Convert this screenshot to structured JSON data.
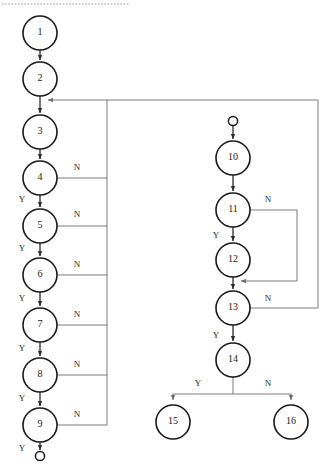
{
  "diagram": {
    "type": "flowchart",
    "background_color": "#ffffff",
    "node_stroke_color": "#1a1a1a",
    "edge_color": "#6e6e6e",
    "dark_edge_color": "#2b2b2b",
    "top_rule_color": "#b9b9b9"
  },
  "top_rule": {
    "name": "dashed-divider",
    "x1": 2,
    "x2": 130,
    "y": 4
  },
  "terminals": [
    {
      "id": "start-left-bottom",
      "label": "",
      "cx": 40,
      "cy": 456,
      "r": 4.6,
      "role": "end"
    },
    {
      "id": "start-right-top",
      "label": "",
      "cx": 233,
      "cy": 121,
      "r": 4.6,
      "role": "start"
    }
  ],
  "nodes": [
    {
      "id": "n1",
      "label": "1",
      "cx": 40,
      "cy": 33,
      "r": 17
    },
    {
      "id": "n2",
      "label": "2",
      "cx": 40,
      "cy": 79,
      "r": 17
    },
    {
      "id": "n3",
      "label": "3",
      "cx": 40,
      "cy": 132,
      "r": 17
    },
    {
      "id": "n4",
      "label": "4",
      "cx": 40,
      "cy": 178,
      "r": 17
    },
    {
      "id": "n5",
      "label": "5",
      "cx": 40,
      "cy": 226,
      "r": 17
    },
    {
      "id": "n6",
      "label": "6",
      "cx": 40,
      "cy": 275,
      "r": 17
    },
    {
      "id": "n7",
      "label": "7",
      "cx": 40,
      "cy": 325,
      "r": 17
    },
    {
      "id": "n8",
      "label": "8",
      "cx": 40,
      "cy": 375,
      "r": 17
    },
    {
      "id": "n9",
      "label": "9",
      "cx": 40,
      "cy": 425,
      "r": 17
    },
    {
      "id": "n10",
      "label": "10",
      "cx": 233,
      "cy": 158,
      "r": 17
    },
    {
      "id": "n11",
      "label": "11",
      "cx": 233,
      "cy": 210,
      "r": 17
    },
    {
      "id": "n12",
      "label": "12",
      "cx": 233,
      "cy": 260,
      "r": 17
    },
    {
      "id": "n13",
      "label": "13",
      "cx": 233,
      "cy": 308,
      "r": 17
    },
    {
      "id": "n14",
      "label": "14",
      "cx": 233,
      "cy": 360,
      "r": 17
    },
    {
      "id": "n15",
      "label": "15",
      "cx": 173,
      "cy": 422,
      "r": 17
    },
    {
      "id": "n16",
      "label": "16",
      "cx": 291,
      "cy": 422,
      "r": 17
    }
  ],
  "edge_labels": [
    {
      "id": "lbl-4-n",
      "text": "N",
      "x": 77,
      "y": 168
    },
    {
      "id": "lbl-5-n",
      "text": "N",
      "x": 77,
      "y": 215
    },
    {
      "id": "lbl-6-n",
      "text": "N",
      "x": 77,
      "y": 265
    },
    {
      "id": "lbl-7-n",
      "text": "N",
      "x": 77,
      "y": 315
    },
    {
      "id": "lbl-8-n",
      "text": "N",
      "x": 77,
      "y": 365
    },
    {
      "id": "lbl-9-n",
      "text": "N",
      "x": 77,
      "y": 415
    },
    {
      "id": "lbl-4-y",
      "text": "Y",
      "x": 22,
      "y": 200
    },
    {
      "id": "lbl-5-y",
      "text": "Y",
      "x": 22,
      "y": 249
    },
    {
      "id": "lbl-6-y",
      "text": "Y",
      "x": 22,
      "y": 299
    },
    {
      "id": "lbl-7-y",
      "text": "Y",
      "x": 22,
      "y": 349
    },
    {
      "id": "lbl-8-y",
      "text": "Y",
      "x": 22,
      "y": 399
    },
    {
      "id": "lbl-9-y",
      "text": "Y",
      "x": 22,
      "y": 449
    },
    {
      "id": "lbl-11-n",
      "text": "N",
      "x": 268,
      "y": 200
    },
    {
      "id": "lbl-11-y",
      "text": "Y",
      "x": 216,
      "y": 236
    },
    {
      "id": "lbl-13-n",
      "text": "N",
      "x": 268,
      "y": 299
    },
    {
      "id": "lbl-13-y",
      "text": "Y",
      "x": 216,
      "y": 336
    },
    {
      "id": "lbl-14-y",
      "text": "Y",
      "x": 198,
      "y": 384
    },
    {
      "id": "lbl-14-n",
      "text": "N",
      "x": 268,
      "y": 384
    }
  ],
  "edges": [
    {
      "id": "e-1-2",
      "from": "n1",
      "to": "n2",
      "kind": "vertical-arrow",
      "label": ""
    },
    {
      "id": "e-2-3",
      "from": "n2",
      "to": "n3",
      "kind": "vertical-arrow",
      "label": ""
    },
    {
      "id": "e-3-4",
      "from": "n3",
      "to": "n4",
      "kind": "vertical-arrow",
      "label": ""
    },
    {
      "id": "e-4-5",
      "from": "n4",
      "to": "n5",
      "kind": "vertical-arrow",
      "label": "Y"
    },
    {
      "id": "e-5-6",
      "from": "n5",
      "to": "n6",
      "kind": "vertical-arrow",
      "label": "Y"
    },
    {
      "id": "e-6-7",
      "from": "n6",
      "to": "n7",
      "kind": "vertical-arrow",
      "label": "Y"
    },
    {
      "id": "e-7-8",
      "from": "n7",
      "to": "n8",
      "kind": "vertical-arrow",
      "label": "Y"
    },
    {
      "id": "e-8-9",
      "from": "n8",
      "to": "n9",
      "kind": "vertical-arrow",
      "label": "Y"
    },
    {
      "id": "e-9-end",
      "from": "n9",
      "to": "start-left-bottom",
      "kind": "vertical-arrow",
      "label": "Y"
    },
    {
      "id": "e-4-n",
      "from": "n4",
      "to": "feedback-bus-left",
      "kind": "right-to-bus",
      "label": "N"
    },
    {
      "id": "e-5-n",
      "from": "n5",
      "to": "feedback-bus-left",
      "kind": "right-to-bus",
      "label": "N"
    },
    {
      "id": "e-6-n",
      "from": "n6",
      "to": "feedback-bus-left",
      "kind": "right-to-bus",
      "label": "N"
    },
    {
      "id": "e-7-n",
      "from": "n7",
      "to": "feedback-bus-left",
      "kind": "right-to-bus",
      "label": "N"
    },
    {
      "id": "e-8-n",
      "from": "n8",
      "to": "feedback-bus-left",
      "kind": "right-to-bus",
      "label": "N"
    },
    {
      "id": "e-9-n",
      "from": "n9",
      "to": "feedback-bus-left",
      "kind": "right-to-bus",
      "label": "N"
    },
    {
      "id": "e-bus-to-3",
      "from": "feedback-bus-left",
      "to": "e-2-3",
      "kind": "feedback-arrow",
      "label": ""
    },
    {
      "id": "e-start-10",
      "from": "start-right-top",
      "to": "n10",
      "kind": "vertical-arrow",
      "label": ""
    },
    {
      "id": "e-10-11",
      "from": "n10",
      "to": "n11",
      "kind": "vertical-arrow",
      "label": ""
    },
    {
      "id": "e-11-12",
      "from": "n11",
      "to": "n12",
      "kind": "vertical-arrow",
      "label": "Y"
    },
    {
      "id": "e-12-13",
      "from": "n12",
      "to": "n13",
      "kind": "vertical-arrow",
      "label": ""
    },
    {
      "id": "e-13-14",
      "from": "n13",
      "to": "n14",
      "kind": "vertical-arrow",
      "label": "Y"
    },
    {
      "id": "e-11-n",
      "from": "n11",
      "to": "e-12-13",
      "kind": "loop-right",
      "label": "N"
    },
    {
      "id": "e-13-n",
      "from": "n13",
      "to": "e-2-3",
      "kind": "loop-far-right",
      "label": "N"
    },
    {
      "id": "e-14-15",
      "from": "n14",
      "to": "n15",
      "kind": "split-arrow",
      "label": "Y"
    },
    {
      "id": "e-14-16",
      "from": "n14",
      "to": "n16",
      "kind": "split-arrow",
      "label": "N"
    }
  ],
  "buses": {
    "left_feedback_x": 107,
    "left_feedback_top_y": 100,
    "left_feedback_bottom_y": 415,
    "inner_loop_x": 297,
    "far_right_x": 318,
    "merge_y": 100,
    "merge_target_x": 40,
    "split_bar_y": 394
  }
}
